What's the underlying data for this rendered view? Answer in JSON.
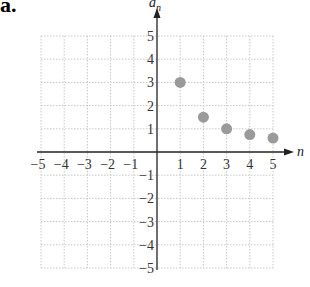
{
  "part_label": "a.",
  "chart_data": {
    "type": "scatter",
    "title": "",
    "xlabel": "n",
    "ylabel": "a_n",
    "xlim": [
      -5,
      5
    ],
    "ylim": [
      -5,
      5
    ],
    "grid": true,
    "x_ticks": [
      "-5",
      "-4",
      "-3",
      "-2",
      "-1",
      "1",
      "2",
      "3",
      "4",
      "5"
    ],
    "y_ticks": [
      "5",
      "4",
      "3",
      "2",
      "1",
      "-1",
      "-2",
      "-3",
      "-4",
      "-5"
    ],
    "points": [
      {
        "n": 1,
        "a_n": 3
      },
      {
        "n": 2,
        "a_n": 1.5
      },
      {
        "n": 3,
        "a_n": 1
      },
      {
        "n": 4,
        "a_n": 0.75
      },
      {
        "n": 5,
        "a_n": 0.6
      }
    ],
    "point_color": "#9a9a9a"
  }
}
